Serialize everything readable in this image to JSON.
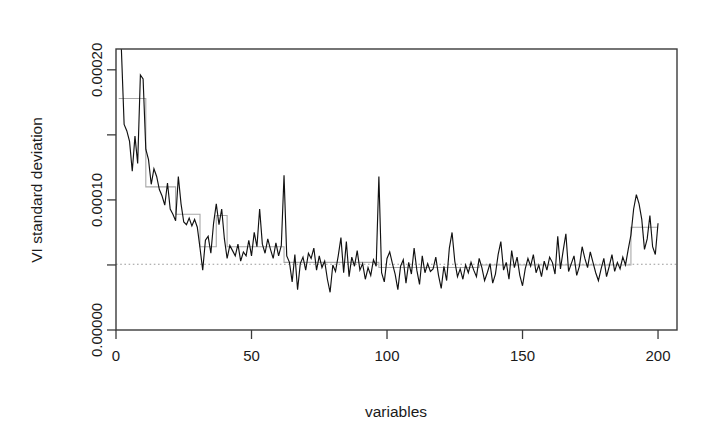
{
  "figure": {
    "background": "#ffffff",
    "plot_area": {
      "left": 116,
      "top": 49,
      "right": 677,
      "bottom": 330
    }
  },
  "chart_data": {
    "type": "line",
    "title": "",
    "xlabel": "variables",
    "ylabel": "VI standard deviation",
    "xlim": [
      0,
      207
    ],
    "ylim": [
      0.0,
      0.000216
    ],
    "grid": false,
    "legend": null,
    "xticks": [
      0,
      50,
      100,
      150,
      200
    ],
    "xtick_labels": [
      "0",
      "50",
      "100",
      "150",
      "200"
    ],
    "yticks": [
      0.0,
      5e-05,
      0.0001,
      0.00015,
      0.0002
    ],
    "ytick_labels": [
      "0.00000",
      "",
      "0.00010",
      "",
      "0.00020"
    ],
    "ytick_labels_shown": [
      "0.00000",
      "0.00010",
      "0.00020"
    ],
    "colors": {
      "data_line": "#111111",
      "step_line": "#a8a8a8",
      "reference_line": "#9a9a9a",
      "axis": "#3b3b3b",
      "text": "#1a1a1a"
    },
    "reference_line": {
      "style": "dotted",
      "orientation": "horizontal",
      "y": 5.05e-05,
      "label": ""
    },
    "series": [
      {
        "name": "VI standard deviation",
        "style": "solid",
        "color": "#111111",
        "x": [
          1,
          2,
          3,
          4,
          5,
          6,
          7,
          8,
          9,
          10,
          11,
          12,
          13,
          14,
          15,
          16,
          17,
          18,
          19,
          20,
          21,
          22,
          23,
          24,
          25,
          26,
          27,
          28,
          29,
          30,
          31,
          32,
          33,
          34,
          35,
          36,
          37,
          38,
          39,
          40,
          41,
          42,
          43,
          44,
          45,
          46,
          47,
          48,
          49,
          50,
          51,
          52,
          53,
          54,
          55,
          56,
          57,
          58,
          59,
          60,
          61,
          62,
          63,
          64,
          65,
          66,
          67,
          68,
          69,
          70,
          71,
          72,
          73,
          74,
          75,
          76,
          77,
          78,
          79,
          80,
          81,
          82,
          83,
          84,
          85,
          86,
          87,
          88,
          89,
          90,
          91,
          92,
          93,
          94,
          95,
          96,
          97,
          98,
          99,
          100,
          101,
          102,
          103,
          104,
          105,
          106,
          107,
          108,
          109,
          110,
          111,
          112,
          113,
          114,
          115,
          116,
          117,
          118,
          119,
          120,
          121,
          122,
          123,
          124,
          125,
          126,
          127,
          128,
          129,
          130,
          131,
          132,
          133,
          134,
          135,
          136,
          137,
          138,
          139,
          140,
          141,
          142,
          143,
          144,
          145,
          146,
          147,
          148,
          149,
          150,
          151,
          152,
          153,
          154,
          155,
          156,
          157,
          158,
          159,
          160,
          161,
          162,
          163,
          164,
          165,
          166,
          167,
          168,
          169,
          170,
          171,
          172,
          173,
          174,
          175,
          176,
          177,
          178,
          179,
          180,
          181,
          182,
          183,
          184,
          185,
          186,
          187,
          188,
          189,
          190,
          191,
          192,
          193,
          194,
          195,
          196,
          197,
          198,
          199,
          200
        ],
        "values": [
          0.000246,
          0.000215,
          0.000158,
          0.000153,
          0.000145,
          0.000122,
          0.000149,
          0.000128,
          0.000196,
          0.000193,
          0.000139,
          0.000131,
          0.000112,
          0.000124,
          0.000118,
          0.000108,
          0.000103,
          9.6e-05,
          0.000113,
          9.3e-05,
          8.9e-05,
          8.4e-05,
          0.000118,
          9.7e-05,
          8.3e-05,
          8.1e-05,
          8.6e-05,
          8e-05,
          8.5e-05,
          7.9e-05,
          6.3e-05,
          4.6e-05,
          6.9e-05,
          7.2e-05,
          5.9e-05,
          8.2e-05,
          9.7e-05,
          8.1e-05,
          9.3e-05,
          7e-05,
          5.5e-05,
          6.5e-05,
          6.1e-05,
          5.7e-05,
          6.6e-05,
          5.3e-05,
          6e-05,
          5.7e-05,
          6.9e-05,
          5.7e-05,
          7.5e-05,
          6.4e-05,
          9.3e-05,
          6.6e-05,
          5.9e-05,
          7e-05,
          6.2e-05,
          5.5e-05,
          6.7e-05,
          5.7e-05,
          6.5e-05,
          0.000119,
          5.7e-05,
          5.2e-05,
          3.7e-05,
          5.8e-05,
          3.1e-05,
          5.1e-05,
          5.6e-05,
          4.6e-05,
          5.9e-05,
          5.5e-05,
          6.3e-05,
          4.6e-05,
          5.7e-05,
          4.8e-05,
          5.3e-05,
          3.9e-05,
          2.9e-05,
          5e-05,
          4.5e-05,
          5.7e-05,
          7.1e-05,
          4.4e-05,
          6.8e-05,
          4.1e-05,
          5.6e-05,
          4.9e-05,
          6.1e-05,
          4.6e-05,
          5.1e-05,
          3.9e-05,
          4.8e-05,
          4.2e-05,
          5.4e-05,
          4.9e-05,
          0.000118,
          4.4e-05,
          3.7e-05,
          5.5e-05,
          6e-05,
          5.1e-05,
          4.3e-05,
          3.1e-05,
          4.9e-05,
          5.4e-05,
          3.6e-05,
          5.2e-05,
          4.3e-05,
          6.3e-05,
          4.6e-05,
          3.5e-05,
          5.7e-05,
          4.4e-05,
          5.1e-05,
          4.5e-05,
          4.7e-05,
          5.6e-05,
          4.2e-05,
          3.2e-05,
          4.9e-05,
          3.8e-05,
          6.3e-05,
          7.5e-05,
          5.3e-05,
          4.1e-05,
          4.7e-05,
          3.9e-05,
          5e-05,
          4.4e-05,
          5.2e-05,
          4.6e-05,
          4.1e-05,
          5.5e-05,
          4.8e-05,
          3.8e-05,
          4.4e-05,
          5.1e-05,
          3.6e-05,
          4.3e-05,
          5.8e-05,
          6.8e-05,
          4.6e-05,
          5.2e-05,
          3.9e-05,
          6.1e-05,
          4.8e-05,
          5.6e-05,
          4.2e-05,
          3.4e-05,
          4.7e-05,
          5.5e-05,
          4.9e-05,
          5.8e-05,
          4.4e-05,
          5e-05,
          4.1e-05,
          5.3e-05,
          4.6e-05,
          5.6e-05,
          5.2e-05,
          4.3e-05,
          7.2e-05,
          4.7e-05,
          6.1e-05,
          7.4e-05,
          4.5e-05,
          5.1e-05,
          5.7e-05,
          4.2e-05,
          4.9e-05,
          6.4e-05,
          5.5e-05,
          4.8e-05,
          6e-05,
          5.2e-05,
          4.4e-05,
          3.8e-05,
          4.7e-05,
          5.5e-05,
          4.1e-05,
          4.9e-05,
          5.8e-05,
          4.5e-05,
          5.2e-05,
          4.7e-05,
          5.6e-05,
          5e-05,
          6.2e-05,
          7.3e-05,
          9.3e-05,
          0.000104,
          9.7e-05,
          8.5e-05,
          6.2e-05,
          7e-05,
          8.8e-05,
          6.4e-05,
          5.8e-05,
          8.2e-05
        ]
      },
      {
        "name": "segment means",
        "style": "step",
        "color": "#a8a8a8",
        "segments": [
          {
            "x_start": 1,
            "x_end": 11,
            "value": 0.000178
          },
          {
            "x_start": 11,
            "x_end": 22,
            "value": 0.00011
          },
          {
            "x_start": 22,
            "x_end": 31,
            "value": 8.9e-05
          },
          {
            "x_start": 31,
            "x_end": 37,
            "value": 6.4e-05
          },
          {
            "x_start": 37,
            "x_end": 41,
            "value": 8.8e-05
          },
          {
            "x_start": 41,
            "x_end": 62,
            "value": 6.4e-05
          },
          {
            "x_start": 62,
            "x_end": 97,
            "value": 5.2e-05
          },
          {
            "x_start": 97,
            "x_end": 134,
            "value": 4.8e-05
          },
          {
            "x_start": 134,
            "x_end": 190,
            "value": 5e-05
          },
          {
            "x_start": 190,
            "x_end": 200,
            "value": 7.9e-05
          }
        ]
      }
    ]
  }
}
